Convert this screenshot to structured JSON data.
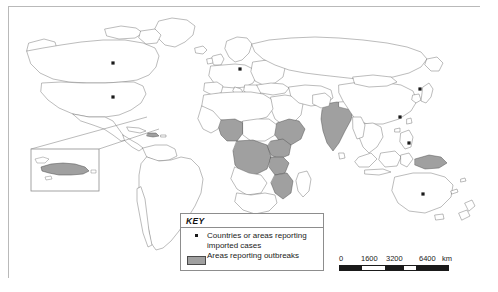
{
  "map": {
    "title": "World map of countries or areas reporting imported cases and areas reporting outbreaks",
    "projection": "world-equirectangular",
    "frame_color": "#b9b9b9",
    "land_outline_color": "#555555",
    "ocean_color": "#ffffff",
    "outbreak_fill": "#a0a0a0",
    "dot_color": "#1a1a1a"
  },
  "legend": {
    "title": "KEY",
    "items": [
      {
        "marker": "dot",
        "label": "Countries or areas reporting imported cases"
      },
      {
        "marker": "swatch",
        "label": "Areas reporting outbreaks"
      }
    ]
  },
  "scale": {
    "ticks": [
      "0",
      "1600",
      "3200",
      "6400"
    ],
    "unit": "km"
  },
  "inset": {
    "name": "caribbean-hispaniola-inset",
    "shaded_area": "Hispaniola"
  },
  "imported_case_dots": [
    {
      "name": "Canada",
      "x": 104,
      "y": 56
    },
    {
      "name": "United States",
      "x": 104,
      "y": 90
    },
    {
      "name": "Germany",
      "x": 231,
      "y": 62
    },
    {
      "name": "China",
      "x": 391,
      "y": 110
    },
    {
      "name": "Japan",
      "x": 411,
      "y": 82
    },
    {
      "name": "Philippines",
      "x": 400,
      "y": 136
    },
    {
      "name": "Australia",
      "x": 414,
      "y": 187
    }
  ],
  "outbreak_areas": [
    "Nigeria",
    "Cameroon",
    "Democratic Republic of the Congo",
    "Ethiopia",
    "Somalia",
    "Kenya",
    "Uganda",
    "Tanzania",
    "Mozambique",
    "India",
    "Papua New Guinea",
    "Hispaniola"
  ]
}
